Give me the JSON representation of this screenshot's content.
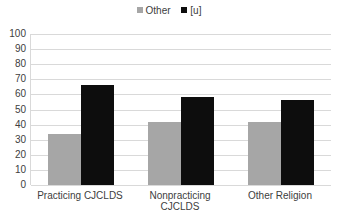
{
  "chart_data": {
    "type": "bar",
    "title": "",
    "xlabel": "",
    "ylabel": "",
    "ylim": [
      0,
      100
    ],
    "yticks": [
      0,
      10,
      20,
      30,
      40,
      50,
      60,
      70,
      80,
      90,
      100
    ],
    "grid": true,
    "legend_position": "top",
    "categories": [
      "Practicing CJCLDS",
      "Nonpracticing CJCLDS",
      "Other Religion"
    ],
    "series": [
      {
        "name": "Other",
        "color": "#a6a6a6",
        "values": [
          34,
          42,
          42
        ]
      },
      {
        "name": "[u]",
        "color": "#0d0d0d",
        "values": [
          66,
          58,
          56
        ]
      }
    ]
  }
}
